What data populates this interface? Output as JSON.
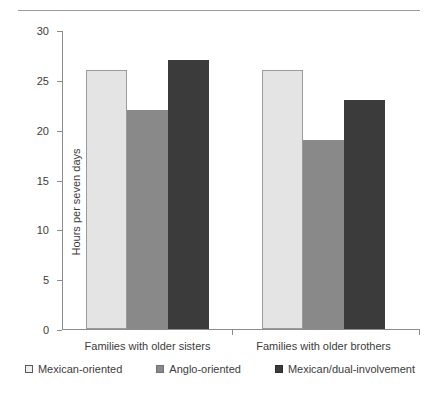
{
  "chart_data": {
    "type": "bar",
    "title": "",
    "xlabel": "",
    "ylabel": "Hours per seven days",
    "ylim": [
      0,
      30
    ],
    "yticks": [
      0,
      5,
      10,
      15,
      20,
      25,
      30
    ],
    "grid": false,
    "legend_position": "bottom",
    "categories": [
      "Families with older sisters",
      "Families with older brothers"
    ],
    "series": [
      {
        "name": "Mexican-oriented",
        "color": "#e4e4e4",
        "values": [
          26,
          26
        ]
      },
      {
        "name": "Anglo-oriented",
        "color": "#898989",
        "values": [
          22,
          19
        ]
      },
      {
        "name": "Mexican/dual-involvement",
        "color": "#3b3b3b",
        "values": [
          27,
          23
        ]
      }
    ]
  },
  "legend": [
    {
      "label": "Mexican-oriented"
    },
    {
      "label": "Anglo-oriented"
    },
    {
      "label": "Mexican/dual-involvement"
    }
  ]
}
